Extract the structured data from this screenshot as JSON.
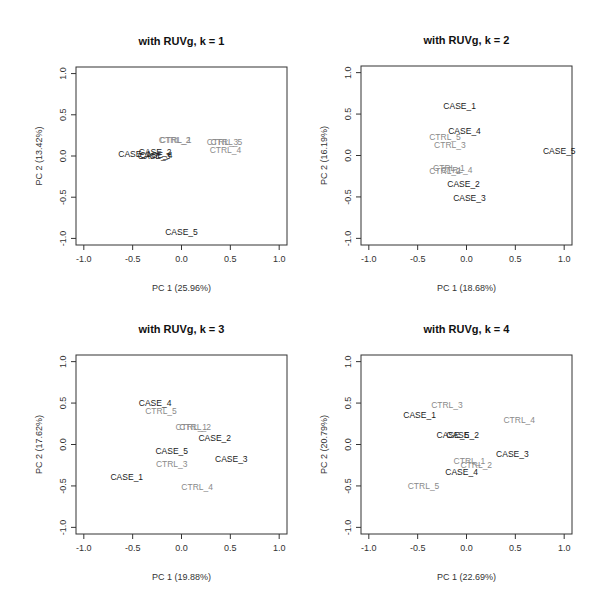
{
  "chart_data": [
    {
      "type": "scatter",
      "title": "with RUVg, k = 1",
      "xlabel": "PC 1 (25.96%)",
      "ylabel": "PC 2 (13.42%)",
      "xlim": [
        -1.0,
        1.0
      ],
      "ylim": [
        -1.0,
        1.0
      ],
      "xticks": [
        "-1.0",
        "-0.5",
        "0.0",
        "0.5",
        "1.0"
      ],
      "yticks": [
        "-1.0",
        "-0.5",
        "0.0",
        "0.5",
        "1.0"
      ],
      "grid": false,
      "points": [
        {
          "label": "CASE_1",
          "group": "case",
          "x": -0.48,
          "y": 0.02
        },
        {
          "label": "CASE_2",
          "group": "case",
          "x": -0.27,
          "y": 0.05
        },
        {
          "label": "CASE_3",
          "group": "case",
          "x": -0.28,
          "y": 0.0
        },
        {
          "label": "CASE_4",
          "group": "case",
          "x": -0.26,
          "y": 0.01
        },
        {
          "label": "CASE_5",
          "group": "case",
          "x": 0.0,
          "y": -0.92
        },
        {
          "label": "CTRL_1",
          "group": "ctrl",
          "x": -0.06,
          "y": 0.2
        },
        {
          "label": "CTRL_2",
          "group": "ctrl",
          "x": -0.07,
          "y": 0.19
        },
        {
          "label": "CTRL_3",
          "group": "ctrl",
          "x": 0.42,
          "y": 0.17
        },
        {
          "label": "CTRL_5",
          "group": "ctrl",
          "x": 0.46,
          "y": 0.17
        },
        {
          "label": "CTRL_4",
          "group": "ctrl",
          "x": 0.45,
          "y": 0.07
        }
      ]
    },
    {
      "type": "scatter",
      "title": "with RUVg, k = 2",
      "xlabel": "PC 1 (18.68%)",
      "ylabel": "PC 2 (16.19%)",
      "xlim": [
        -1.0,
        1.0
      ],
      "ylim": [
        -1.0,
        1.0
      ],
      "xticks": [
        "-1.0",
        "-0.5",
        "0.0",
        "0.5",
        "1.0"
      ],
      "yticks": [
        "-1.0",
        "-0.5",
        "0.0",
        "0.5",
        "1.0"
      ],
      "grid": false,
      "points": [
        {
          "label": "CASE_1",
          "group": "case",
          "x": -0.07,
          "y": 0.6
        },
        {
          "label": "CASE_4",
          "group": "case",
          "x": -0.02,
          "y": 0.3
        },
        {
          "label": "CTRL_5",
          "group": "ctrl",
          "x": -0.22,
          "y": 0.22
        },
        {
          "label": "CTRL_3",
          "group": "ctrl",
          "x": -0.17,
          "y": 0.13
        },
        {
          "label": "CASE_5",
          "group": "case",
          "x": 0.95,
          "y": 0.06
        },
        {
          "label": "CTRL_1",
          "group": "ctrl",
          "x": -0.18,
          "y": -0.15
        },
        {
          "label": "CTRL_4",
          "group": "ctrl",
          "x": -0.1,
          "y": -0.17
        },
        {
          "label": "CTRL_2",
          "group": "ctrl",
          "x": -0.22,
          "y": -0.19
        },
        {
          "label": "CASE_2",
          "group": "case",
          "x": -0.03,
          "y": -0.34
        },
        {
          "label": "CASE_3",
          "group": "case",
          "x": 0.03,
          "y": -0.51
        }
      ]
    },
    {
      "type": "scatter",
      "title": "with RUVg, k = 3",
      "xlabel": "PC 1 (19.88%)",
      "ylabel": "PC 2 (17.62%)",
      "xlim": [
        -1.0,
        1.0
      ],
      "ylim": [
        -1.0,
        1.0
      ],
      "xticks": [
        "-1.0",
        "-0.5",
        "0.0",
        "0.5",
        "1.0"
      ],
      "yticks": [
        "-1.0",
        "-0.5",
        "0.0",
        "0.5",
        "1.0"
      ],
      "grid": false,
      "points": [
        {
          "label": "CASE_4",
          "group": "case",
          "x": -0.27,
          "y": 0.5
        },
        {
          "label": "CTRL_5",
          "group": "ctrl",
          "x": -0.21,
          "y": 0.4
        },
        {
          "label": "CTRL_1",
          "group": "ctrl",
          "x": 0.1,
          "y": 0.21
        },
        {
          "label": "CTRL_2",
          "group": "ctrl",
          "x": 0.14,
          "y": 0.21
        },
        {
          "label": "CASE_2",
          "group": "case",
          "x": 0.34,
          "y": 0.08
        },
        {
          "label": "CASE_5",
          "group": "case",
          "x": -0.1,
          "y": -0.08
        },
        {
          "label": "CTRL_3",
          "group": "ctrl",
          "x": -0.1,
          "y": -0.24
        },
        {
          "label": "CASE_3",
          "group": "case",
          "x": 0.51,
          "y": -0.18
        },
        {
          "label": "CASE_1",
          "group": "case",
          "x": -0.56,
          "y": -0.39
        },
        {
          "label": "CTRL_4",
          "group": "ctrl",
          "x": 0.16,
          "y": -0.51
        }
      ]
    },
    {
      "type": "scatter",
      "title": "with RUVg, k = 4",
      "xlabel": "PC 1 (22.69%)",
      "ylabel": "PC 2 (20.79%)",
      "xlim": [
        -1.0,
        1.0
      ],
      "ylim": [
        -1.0,
        1.0
      ],
      "xticks": [
        "-1.0",
        "-0.5",
        "0.0",
        "0.5",
        "1.0"
      ],
      "yticks": [
        "-1.0",
        "-0.5",
        "0.0",
        "0.5",
        "1.0"
      ],
      "grid": false,
      "points": [
        {
          "label": "CTRL_3",
          "group": "ctrl",
          "x": -0.2,
          "y": 0.48
        },
        {
          "label": "CASE_1",
          "group": "case",
          "x": -0.48,
          "y": 0.35
        },
        {
          "label": "CTRL_4",
          "group": "ctrl",
          "x": 0.54,
          "y": 0.3
        },
        {
          "label": "CASE_5",
          "group": "case",
          "x": -0.14,
          "y": 0.12
        },
        {
          "label": "CASE_2",
          "group": "case",
          "x": -0.04,
          "y": 0.11
        },
        {
          "label": "CASE_3",
          "group": "case",
          "x": 0.47,
          "y": -0.12
        },
        {
          "label": "CTRL_1",
          "group": "ctrl",
          "x": 0.03,
          "y": -0.2
        },
        {
          "label": "CTRL_2",
          "group": "ctrl",
          "x": 0.1,
          "y": -0.25
        },
        {
          "label": "CASE_4",
          "group": "case",
          "x": -0.05,
          "y": -0.33
        },
        {
          "label": "CTRL_5",
          "group": "ctrl",
          "x": -0.44,
          "y": -0.5
        }
      ]
    }
  ],
  "colors": {
    "case": "#1a1a1a",
    "ctrl": "#8a8a8a",
    "axis": "#333333"
  }
}
